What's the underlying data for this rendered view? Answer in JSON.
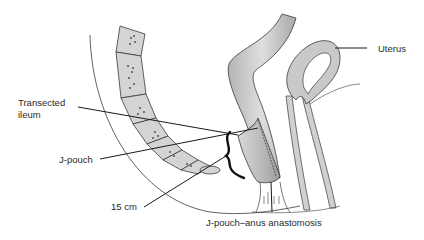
{
  "diagram": {
    "labels": {
      "uterus": "Uterus",
      "transected_ileum_line1": "Transected",
      "transected_ileum_line2": "ileum",
      "j_pouch": "J-pouch",
      "length": "15 cm",
      "anastomosis": "J-pouch–anus anastomosis"
    },
    "colors": {
      "tissue_fill": "#c9c9c9",
      "tissue_dark": "#9a9a9a",
      "outline": "#3a3a3a",
      "leader_line": "#1a1a1a",
      "bracket": "#111111",
      "text": "#2a2a2a"
    }
  }
}
